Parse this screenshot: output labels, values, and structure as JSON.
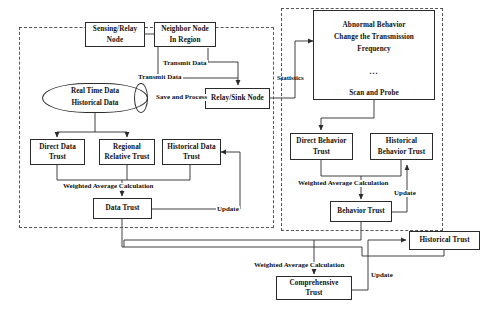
{
  "diagram": {
    "panels": [
      {
        "id": "data-trust-panel",
        "label": ""
      },
      {
        "id": "behavior-trust-panel",
        "label": ""
      }
    ],
    "nodes": {
      "sensing_relay_node": {
        "line1": "Sensing/Relay",
        "line2": "Node"
      },
      "neighbor_node": {
        "line1": "Neighbor Node",
        "line2": "In Region"
      },
      "data_store": {
        "line1": "Real Time  Data",
        "line2": "Historical   Data"
      },
      "relay_sink_node": {
        "line1": "Relay/Sink Node"
      },
      "direct_data_trust": {
        "line1": "Direct Data",
        "line2": "Trust"
      },
      "regional_relative_trust": {
        "line1": "Regional",
        "line2": "Relative Trust"
      },
      "historical_data_trust": {
        "line1": "Historical Data",
        "line2": "Trust"
      },
      "data_trust": {
        "line1": "Data Trust"
      },
      "abnormal_behavior": {
        "line1": "Abnormal Behavior",
        "line2": "Change the Transmission",
        "line3": "Frequency",
        "line4": "...",
        "line5": "Scan and Probe"
      },
      "direct_behavior_trust": {
        "line1": "Direct Behavior",
        "line2": "Trust"
      },
      "historical_behavior_trust": {
        "line1": "Historical",
        "line2": "Behavior Trust"
      },
      "behavior_trust": {
        "line1": "Behavior Trust"
      },
      "historical_trust": {
        "line1": "Historical Trust"
      },
      "comprehensive_trust": {
        "line1": "Comprehensive",
        "line2": "Trust"
      }
    },
    "edge_labels": {
      "transmit_data_neighbor": "Transmit Data",
      "transmit_data_sensing": "Transmit Data",
      "save_and_process": "Save and Process",
      "statistics": "Statistics",
      "weighted_average_data": "Weighted Average Calculation",
      "weighted_average_behavior": "Weighted Average Calculation",
      "weighted_average_comprehensive": "Weighted Average Calculation",
      "update_data": "Update",
      "update_behavior": "Update",
      "update_comprehensive": "Update"
    },
    "colors": {
      "stroke": "#2b2b2b",
      "panel_stroke": "#555555",
      "text": "#111111",
      "background": "#ffffff"
    }
  }
}
